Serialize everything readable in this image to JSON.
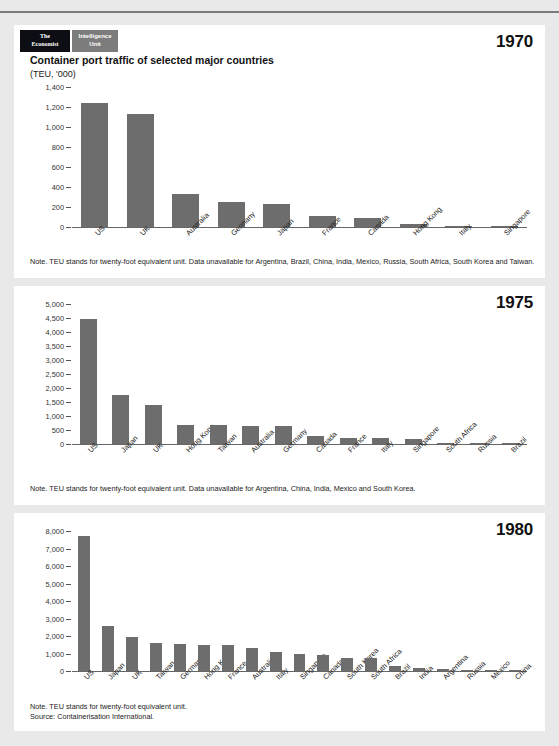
{
  "brand": {
    "economist_line1": "The",
    "economist_line2": "Economist",
    "eiu_line1": "Intelligence",
    "eiu_line2": "Unit"
  },
  "header": {
    "title": "Container port traffic of selected major countries",
    "units": "(TEU, '000)"
  },
  "charts": [
    {
      "year": "1970",
      "note": "Note. TEU stands for twenty-foot equivalent unit. Data unavailable for Argentina, Brazil, China, India, Mexico, Russia, South Africa, South Korea and Taiwan.",
      "ticks": [
        "1,400",
        "1,200",
        "1,000",
        "800",
        "600",
        "400",
        "200",
        "0"
      ],
      "chart_data": {
        "type": "bar",
        "title": "Container port traffic of selected major countries",
        "subtitle": "1970",
        "xlabel": "",
        "ylabel": "TEU, '000",
        "ylim": [
          0,
          1400
        ],
        "ytick_step": 200,
        "grid": false,
        "legend": "none",
        "categories": [
          "US",
          "UK",
          "Australia",
          "Germany",
          "Japan",
          "France",
          "Canada",
          "Hong Kong",
          "Italy",
          "Singapore"
        ],
        "values": [
          1240,
          1130,
          330,
          255,
          230,
          110,
          95,
          35,
          8,
          4
        ]
      }
    },
    {
      "year": "1975",
      "note": "Note. TEU stands for twenty-foot equivalent unit. Data unavailable for Argentina, China, India, Mexico and South Korea.",
      "ticks": [
        "5,000",
        "4,500",
        "4,000",
        "3,500",
        "3,000",
        "2,500",
        "2,000",
        "1,500",
        "1,000",
        "500",
        "0"
      ],
      "chart_data": {
        "type": "bar",
        "title": "Container port traffic of selected major countries",
        "subtitle": "1975",
        "xlabel": "",
        "ylabel": "TEU, '000",
        "ylim": [
          0,
          5000
        ],
        "ytick_step": 500,
        "grid": false,
        "legend": "none",
        "categories": [
          "US",
          "Japan",
          "UK",
          "Hong Kong",
          "Taiwan",
          "Australia",
          "Germany",
          "Canada",
          "France",
          "Italy",
          "Singapore",
          "South Africa",
          "Russia",
          "Brazil"
        ],
        "values": [
          4450,
          1760,
          1400,
          680,
          670,
          660,
          645,
          290,
          230,
          215,
          165,
          45,
          40,
          10
        ]
      }
    },
    {
      "year": "1980",
      "note": "Note. TEU stands for twenty-foot equivalent unit.\nSource: Containerisation International.",
      "ticks": [
        "8,000",
        "7,000",
        "6,000",
        "5,000",
        "4,000",
        "3,000",
        "2,000",
        "1,000",
        "0"
      ],
      "chart_data": {
        "type": "bar",
        "title": "Container port traffic of selected major countries",
        "subtitle": "1980",
        "xlabel": "",
        "ylabel": "TEU, '000",
        "ylim": [
          0,
          8000
        ],
        "ytick_step": 1000,
        "grid": false,
        "legend": "none",
        "categories": [
          "US",
          "Japan",
          "UK",
          "Taiwan",
          "Germany",
          "Hong Kong",
          "France",
          "Australia",
          "Italy",
          "Singapore",
          "Canada",
          "South Korea",
          "South Africa",
          "Brazil",
          "India",
          "Argentina",
          "Russia",
          "Mexico",
          "China"
        ],
        "values": [
          7700,
          2600,
          1950,
          1620,
          1560,
          1480,
          1480,
          1330,
          1100,
          950,
          920,
          760,
          720,
          290,
          150,
          130,
          60,
          20,
          10
        ]
      }
    }
  ],
  "footer": {
    "note_line1": "Note. TEU stands for twenty-foot equivalent unit.",
    "note_line2": "Source: Containerisation International."
  }
}
